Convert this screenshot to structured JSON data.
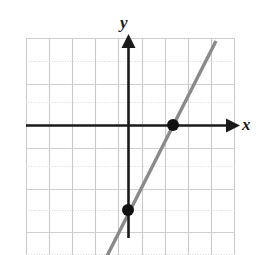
{
  "figure": {
    "kind": "coordinate-plane-line-graph",
    "width": 264,
    "height": 255,
    "background_color": "#ffffff"
  },
  "axes": {
    "x_label": "x",
    "y_label": "y",
    "axis_color": "#1a1a1a",
    "origin_px": {
      "x": 128,
      "y": 125
    },
    "x_axis": {
      "start_px": {
        "x": 26,
        "y": 125
      },
      "end_px": {
        "x": 232,
        "y": 125
      },
      "arrow": "right"
    },
    "y_axis": {
      "start_px": {
        "x": 128,
        "y": 236
      },
      "end_px": {
        "x": 128,
        "y": 40
      },
      "arrow": "up"
    }
  },
  "grid": {
    "left_px": 26,
    "top_px": 38,
    "right_px": 235,
    "bottom_px": 255,
    "cell_px": 23.2,
    "solid_color": "#c9c9c9",
    "dotted_color": "#d8d8d8",
    "border_color": "#c9c9c9"
  },
  "chart_data": {
    "type": "line",
    "title": "",
    "xlabel": "x",
    "ylabel": "y",
    "xlim": [
      -4.4,
      4.6
    ],
    "ylim": [
      -5.6,
      3.8
    ],
    "grid": true,
    "legend": false,
    "series": [
      {
        "name": "line",
        "color": "#8a8a8a",
        "slope": 2,
        "y_intercept": -4,
        "equation": "y = 2x - 4",
        "x": [
          -0.9,
          4.2
        ],
        "y": [
          -5.8,
          4.4
        ],
        "draw_px": {
          "x1": 107,
          "y1": 256,
          "x2": 216,
          "y2": 41
        }
      }
    ],
    "points": [
      {
        "label": "x-intercept",
        "x": 2,
        "y": 0,
        "px": {
          "x": 173,
          "y": 125
        },
        "color": "#111111",
        "radius_px": 6
      },
      {
        "label": "y-intercept",
        "x": 0,
        "y": -4,
        "px": {
          "x": 128,
          "y": 210
        },
        "color": "#111111",
        "radius_px": 6
      }
    ]
  }
}
